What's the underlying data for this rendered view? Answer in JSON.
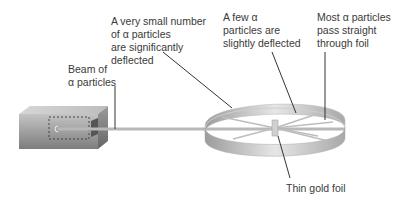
{
  "diagram": {
    "labels": {
      "significant": [
        "A very small number",
        "of α particles",
        "are significantly",
        "deflected"
      ],
      "slight": [
        "A few α",
        "particles are",
        "slightly deflected"
      ],
      "most": [
        "Most α particles",
        "pass straight",
        "through foil"
      ],
      "beam": [
        "Beam of",
        "α particles"
      ],
      "foil": "Thin gold foil"
    },
    "colors": {
      "text": "#3a3a3a",
      "leader": "#333333",
      "beam": "#b8b8b8",
      "box_front": "#9a9a9a",
      "ring": "#cfcfcf"
    }
  }
}
